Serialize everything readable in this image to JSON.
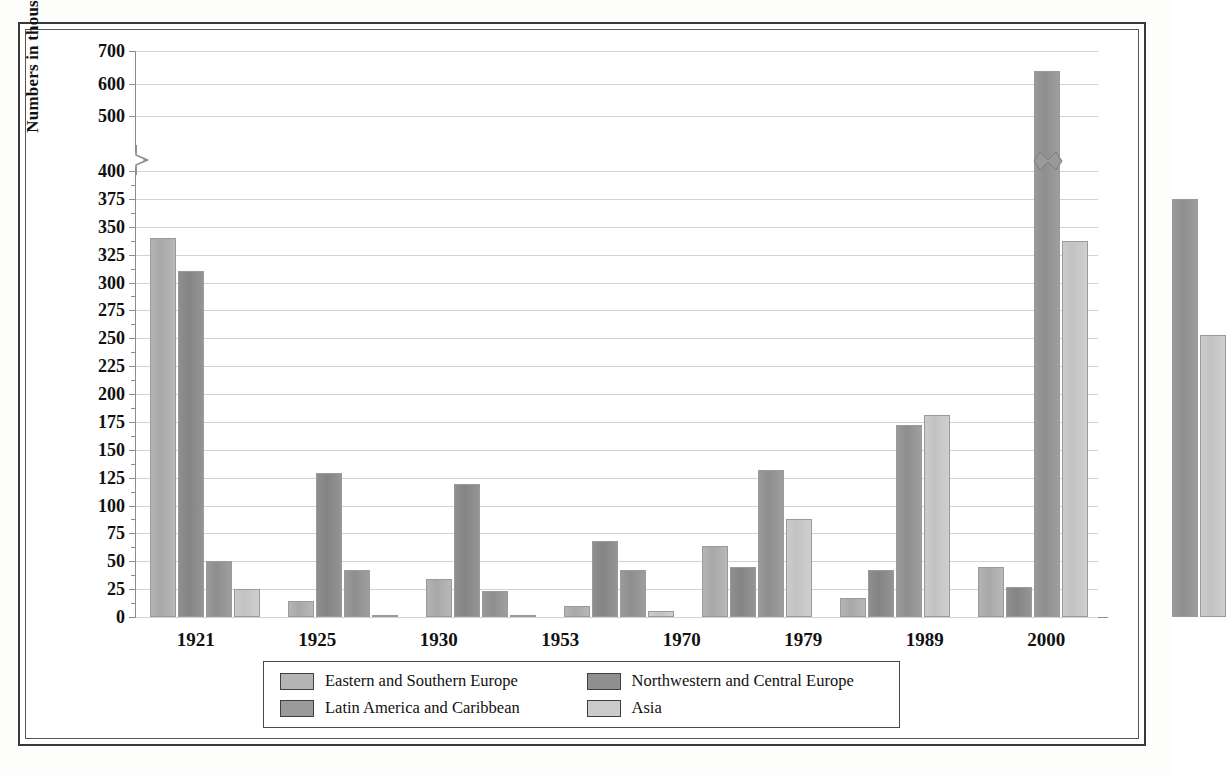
{
  "chart_data": {
    "type": "bar",
    "title": "",
    "xlabel": "",
    "ylabel": "Numbers in thousands",
    "categories": [
      "1921",
      "1925",
      "1930",
      "1953",
      "1970",
      "1979",
      "1989",
      "2000"
    ],
    "ytick_labels": [
      "0",
      "25",
      "50",
      "75",
      "100",
      "125",
      "150",
      "175",
      "200",
      "225",
      "250",
      "275",
      "300",
      "325",
      "350",
      "375",
      "400",
      "500",
      "600",
      "700"
    ],
    "ylim": [
      0,
      700
    ],
    "axis_break": {
      "present": true,
      "between": [
        400,
        500
      ],
      "note": "scale compresses above 400"
    },
    "grid": true,
    "legend_position": "bottom",
    "series": [
      {
        "name": "Eastern and Southern Europe",
        "color": "#b4b4b4",
        "values": [
          340,
          14,
          34,
          10,
          64,
          17,
          45,
          0
        ]
      },
      {
        "name": "Northwestern and Central Europe",
        "color": "#8f8f8f",
        "values": [
          310,
          129,
          119,
          68,
          45,
          42,
          27,
          0
        ]
      },
      {
        "name": "Latin America and Caribbean",
        "color": "#9a9a9a",
        "values": [
          50,
          42,
          23,
          42,
          132,
          172,
          640,
          375
        ]
      },
      {
        "name": "Asia",
        "color": "#cbcbcb",
        "values": [
          25,
          2,
          2,
          5,
          88,
          181,
          337,
          253
        ]
      }
    ]
  },
  "legend": {
    "entries": [
      {
        "label": "Eastern and Southern Europe"
      },
      {
        "label": "Northwestern and Central Europe"
      },
      {
        "label": "Latin America and Caribbean"
      },
      {
        "label": "Asia"
      }
    ]
  }
}
